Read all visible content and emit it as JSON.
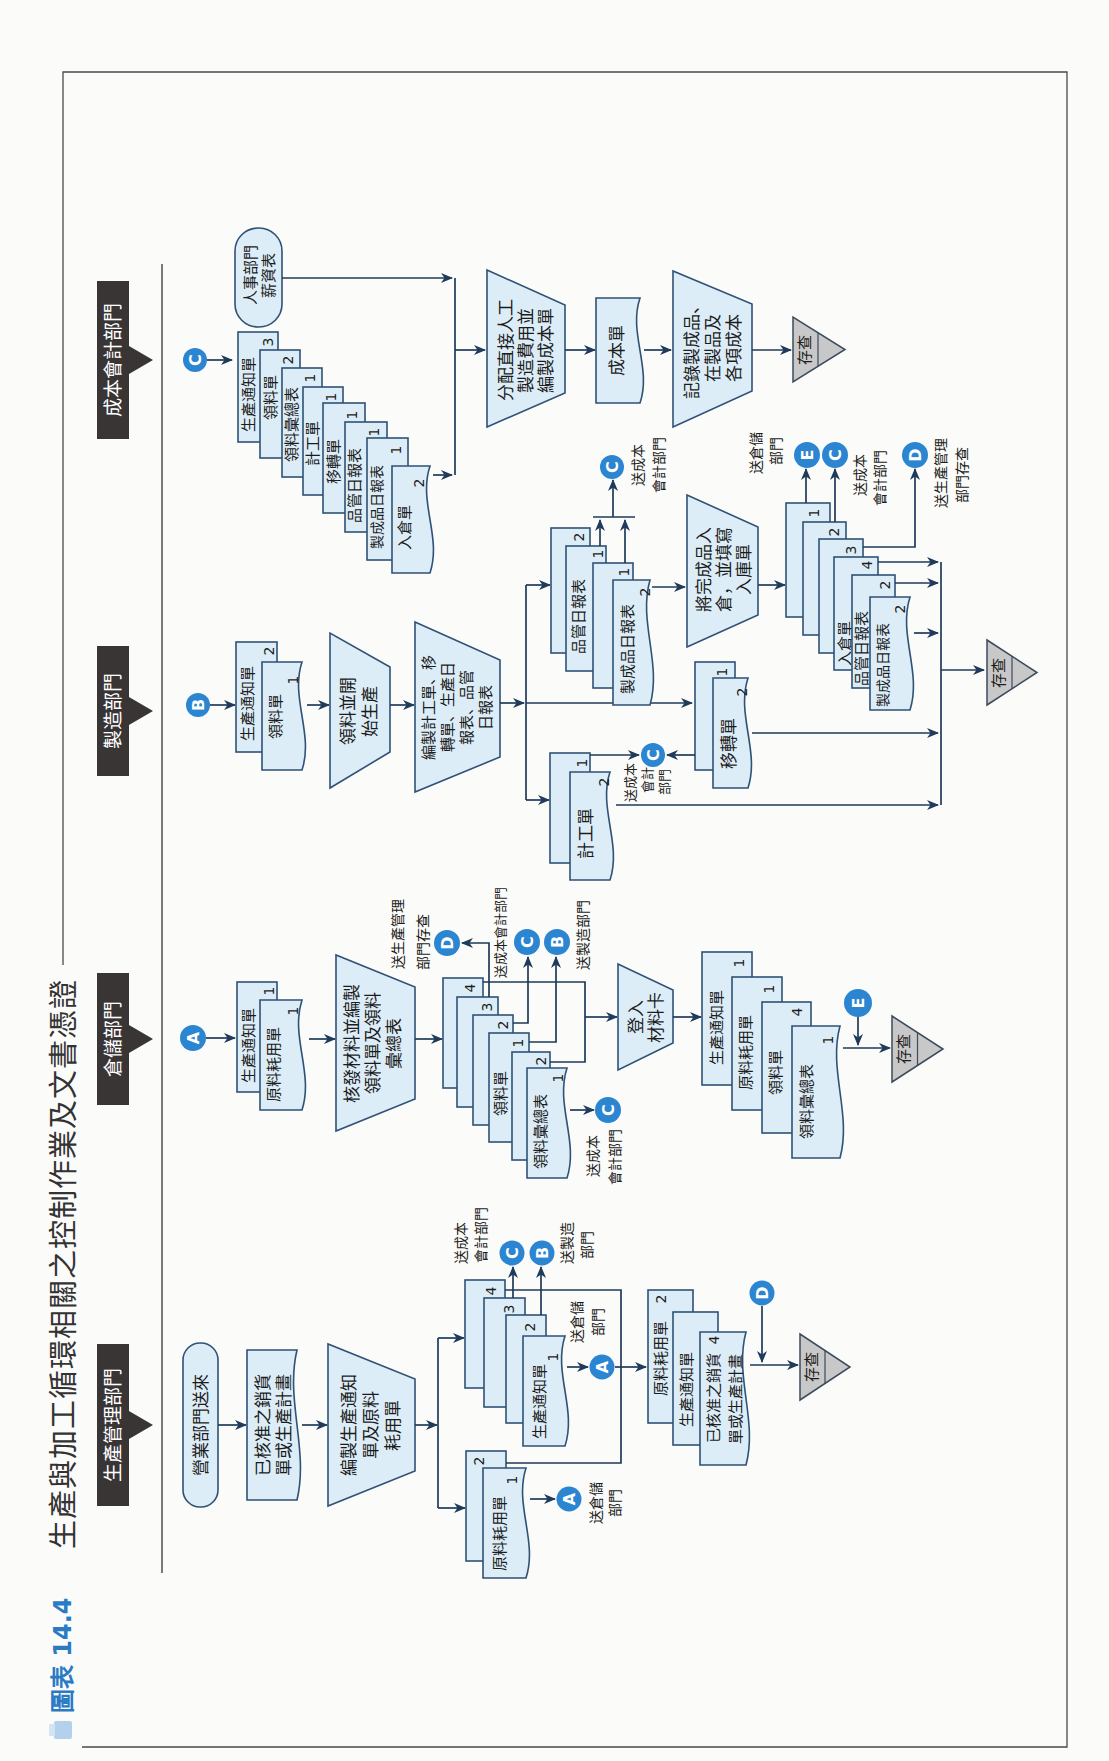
{
  "figure": {
    "number": "圖表 14.4",
    "title": "生產與加工循環相關之控制作業及文書憑證"
  },
  "theme": {
    "box_fill": "#dcedf8",
    "box_stroke": "#2f5276",
    "line": "#1f3a5a",
    "connector_fill": "#2b85d0",
    "header_fill": "#393535",
    "file_fill": "#c8c8c8",
    "figure_number_color": "#2b7bc4"
  },
  "production_mgmt": {
    "header": "生產管理部門",
    "start": "營業部門送來",
    "approved_order": [
      "已核准之銷貨",
      "單或生產計畫"
    ],
    "prepare": [
      "編製生產通知",
      "單及原料",
      "耗用單"
    ],
    "material_slip": {
      "text": "原料耗用單",
      "copies": [
        "1",
        "2"
      ]
    },
    "production_notice": {
      "text": "生產通知單",
      "copies": [
        "1",
        "2",
        "3",
        "4"
      ]
    },
    "to_warehouse_slip": {
      "letter": "A",
      "label": [
        "送倉儲",
        "部門"
      ]
    },
    "to_warehouse_notice": {
      "letter": "A",
      "label": [
        "送倉儲",
        "部門"
      ]
    },
    "to_cost": {
      "letter": "C",
      "label": [
        "送成本",
        "會計部門"
      ]
    },
    "to_mfg": {
      "letter": "B",
      "label": [
        "送製造",
        "部門"
      ]
    },
    "from_warehouse": {
      "letter": "D"
    },
    "file_docs": [
      {
        "text": "原料耗用單",
        "copy": "2"
      },
      {
        "text": "生產通知單"
      },
      {
        "lines": [
          "已核准之銷貨",
          "單或生產計畫"
        ],
        "copy": "4"
      }
    ],
    "file": "存查"
  },
  "warehouse": {
    "header": "倉儲部門",
    "from_pm": {
      "letter": "A"
    },
    "received": [
      {
        "text": "生產通知單",
        "copy": "1"
      },
      {
        "text": "原料耗用單",
        "copy": "1"
      }
    ],
    "issue": [
      "核發材料並編製",
      "領料單及領料",
      "彙總表"
    ],
    "requisition": {
      "text": "領料單",
      "copies": [
        "4",
        "3",
        "2",
        "1"
      ]
    },
    "summary": {
      "text": "領料彙總表",
      "copies": [
        "2",
        "1"
      ]
    },
    "to_pm": {
      "letter": "D",
      "label": [
        "送生產管理",
        "部門存查"
      ]
    },
    "to_cost_req": {
      "letter": "C",
      "label": "送成本會計部門"
    },
    "to_mfg": {
      "letter": "B",
      "label": "送製造部門"
    },
    "to_cost_summary": {
      "letter": "C",
      "label": [
        "送成本",
        "會計部門"
      ]
    },
    "post": [
      "登入",
      "材料卡"
    ],
    "file_docs": [
      {
        "text": "生產通知單",
        "copy": "1"
      },
      {
        "text": "原料耗用單",
        "copy": "1"
      },
      {
        "text": "領料單",
        "copy": "4"
      },
      {
        "text": "領料彙總表",
        "copy": "1"
      }
    ],
    "from_mfg": {
      "letter": "E"
    },
    "file": "存查"
  },
  "manufacturing": {
    "header": "製造部門",
    "from_pm": {
      "letter": "B"
    },
    "received": [
      {
        "text": "生產通知單",
        "copy": "2"
      },
      {
        "text": "領料單",
        "copy": "1"
      }
    ],
    "start_production": [
      "領料並開",
      "始生產"
    ],
    "prepare_reports": [
      "編製計工單、移",
      "轉單、生產日",
      "報表、品管",
      "日報表"
    ],
    "job_ticket": {
      "text": "計工單",
      "copies": [
        "1",
        "2"
      ]
    },
    "transfer_slip": {
      "text": "移轉單",
      "copies": [
        "1",
        "2"
      ]
    },
    "to_cost_tickets": {
      "letter": "C",
      "label": [
        "送成本",
        "會計",
        "部門"
      ]
    },
    "daily_reports": {
      "qc": "品管日報表",
      "fg": "製成品日報表",
      "copies": [
        "2",
        "1",
        "1",
        "2"
      ]
    },
    "to_cost_reports": {
      "letter": "C",
      "label": [
        "送成本",
        "會計部門"
      ]
    },
    "warehousing": [
      "將完成品入",
      "倉，並填寫",
      "入庫單"
    ],
    "receipt_stack": {
      "text": "入倉單",
      "copies": [
        "1",
        "2",
        "3",
        "4"
      ],
      "qc": "品管日報表",
      "qc_copy": "2",
      "fg": "製成品日報表",
      "fg_copy": "2"
    },
    "to_warehouse": {
      "letter": "E",
      "label": [
        "送倉儲",
        "部門"
      ]
    },
    "to_cost_receipt": {
      "letter": "C",
      "label": [
        "送成本",
        "會計部門"
      ]
    },
    "to_pm": {
      "letter": "D",
      "label": [
        "送生產管理",
        "部門存查"
      ]
    },
    "file": "存查"
  },
  "cost_accounting": {
    "header": "成本會計部門",
    "from_depts": {
      "letter": "C"
    },
    "payroll": [
      "人事部門",
      "薪資表"
    ],
    "received": [
      {
        "text": "生產通知單",
        "copy": "3"
      },
      {
        "text": "領料單",
        "copy": "2"
      },
      {
        "text": "領料彙總表",
        "copy": "1"
      },
      {
        "text": "計工單",
        "copy": "1"
      },
      {
        "text": "移轉單",
        "copy": "1"
      },
      {
        "text": "品管日報表",
        "copy": "1"
      },
      {
        "text": "製成品日報表",
        "copy": "1"
      },
      {
        "text": "入倉單",
        "copy": "2"
      }
    ],
    "allocate": [
      "分配直接人工",
      "製造費用並",
      "編製成本單"
    ],
    "cost_sheet": "成本單",
    "record": [
      "記錄製成品、",
      "在製品及",
      "各項成本"
    ],
    "file": "存查"
  }
}
